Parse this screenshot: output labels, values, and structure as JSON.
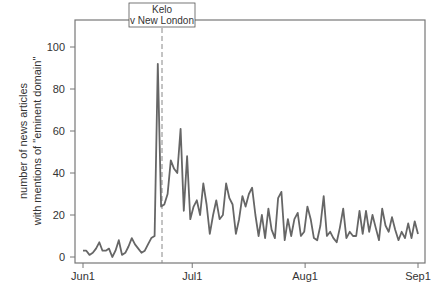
{
  "chart_data": {
    "type": "line",
    "title": "",
    "xlabel": "",
    "ylabel": "number of news articles with mentions of \"eminent domain\"",
    "ylabel_lines": [
      "number of news articles",
      "with mentions of \"eminent domain\""
    ],
    "ylim": [
      0,
      110
    ],
    "yticks": [
      0,
      20,
      40,
      60,
      80,
      100
    ],
    "ytick_labels": [
      "0",
      "20",
      "40",
      "60",
      "80",
      "100"
    ],
    "xticks": [
      {
        "label": "Jun1",
        "day_index": 0
      },
      {
        "label": "Jul1",
        "day_index": 30
      },
      {
        "label": "Aug1",
        "day_index": 61
      },
      {
        "label": "Sep1",
        "day_index": 92
      }
    ],
    "grid": false,
    "legend": null,
    "x_start": "Jun 1",
    "x_end": "Sep 1",
    "series": [
      {
        "name": "news articles",
        "color": "#666666",
        "values": [
          3,
          3,
          1,
          2,
          4,
          7,
          3,
          3,
          4,
          0,
          3,
          8,
          1,
          2,
          5,
          9,
          6,
          4,
          2,
          3,
          6,
          9,
          10,
          92,
          24,
          25,
          30,
          46,
          42,
          40,
          61,
          22,
          48,
          18,
          24,
          27,
          20,
          35,
          25,
          11,
          20,
          27,
          18,
          20,
          35,
          28,
          25,
          11,
          18,
          29,
          24,
          30,
          33,
          20,
          10,
          20,
          9,
          23,
          13,
          9,
          28,
          31,
          8,
          18,
          10,
          18,
          21,
          10,
          12,
          24,
          18,
          9,
          8,
          15,
          29,
          10,
          12,
          9,
          7,
          14,
          23,
          9,
          12,
          10,
          10,
          22,
          11,
          22,
          12,
          20,
          14,
          8,
          23,
          15,
          12,
          19,
          13,
          8,
          12,
          9,
          16,
          9,
          17,
          11
        ]
      }
    ],
    "annotations": [
      {
        "type": "vline",
        "style": "dashed",
        "day_index": 23,
        "label_lines": [
          "Kelo",
          "v New London"
        ],
        "label": "Kelo v New London"
      }
    ]
  }
}
